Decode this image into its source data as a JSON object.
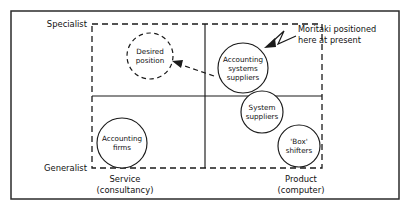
{
  "figure": {
    "type": "two-by-two-positioning-matrix",
    "axes": {
      "vertical_top_label": "Specialist",
      "vertical_bottom_label": "Generalist",
      "horizontal_left_label_line1": "Service",
      "horizontal_left_label_line2": "(consultancy)",
      "horizontal_right_label_line1": "Product",
      "horizontal_right_label_line2": "(computer)"
    },
    "nodes": [
      {
        "id": "desired-position",
        "line1": "Desired",
        "line2": "position",
        "line3": "",
        "style": "dashed"
      },
      {
        "id": "accounting-systems-suppliers",
        "line1": "Accounting",
        "line2": "systems",
        "line3": "suppliers",
        "style": "solid"
      },
      {
        "id": "system-suppliers",
        "line1": "System",
        "line2": "suppliers",
        "line3": "",
        "style": "solid"
      },
      {
        "id": "box-shifters",
        "line1": "'Box'",
        "line2": "shifters",
        "line3": "",
        "style": "solid"
      },
      {
        "id": "accounting-firms",
        "line1": "Accounting",
        "line2": "firms",
        "line3": "",
        "style": "solid"
      }
    ],
    "annotation": {
      "line1": "Moritaki positioned",
      "line2": "here at present"
    },
    "colors": {
      "ink": "#1a1a1a",
      "frame": "#2b2b2b",
      "background": "#ffffff"
    }
  }
}
